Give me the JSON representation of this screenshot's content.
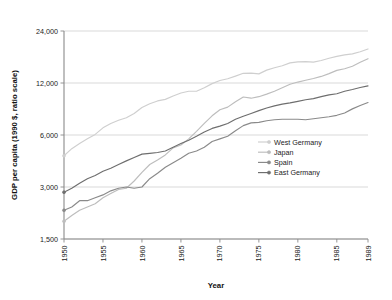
{
  "chart_data": {
    "type": "line",
    "title": "",
    "xlabel": "Year",
    "ylabel": "GDP per capita (1990 $, ratio scale)",
    "yscale": "log",
    "ylim": [
      1500,
      24000
    ],
    "xlim": [
      1950,
      1989
    ],
    "grid": true,
    "legend_position": "center-right",
    "ytick_labels": [
      "1,500",
      "3,000",
      "6,000",
      "12,000",
      "24,000"
    ],
    "ytick_values": [
      1500,
      3000,
      6000,
      12000,
      24000
    ],
    "xtick_labels": [
      "1950",
      "1955",
      "1960",
      "1965",
      "1970",
      "1975",
      "1980",
      "1985",
      "1989"
    ],
    "xtick_values": [
      1950,
      1955,
      1960,
      1965,
      1970,
      1975,
      1980,
      1985,
      1989
    ],
    "x": [
      1950,
      1951,
      1952,
      1953,
      1954,
      1955,
      1956,
      1957,
      1958,
      1959,
      1960,
      1961,
      1962,
      1963,
      1964,
      1965,
      1966,
      1967,
      1968,
      1969,
      1970,
      1971,
      1972,
      1973,
      1974,
      1975,
      1976,
      1977,
      1978,
      1979,
      1980,
      1981,
      1982,
      1983,
      1984,
      1985,
      1986,
      1987,
      1988,
      1989
    ],
    "series": [
      {
        "name": "West Germany",
        "color": "#cfcfcf",
        "values": [
          4550,
          5000,
          5350,
          5700,
          6050,
          6600,
          7000,
          7300,
          7550,
          8000,
          8650,
          9100,
          9450,
          9650,
          10100,
          10500,
          10750,
          10750,
          11250,
          11900,
          12400,
          12700,
          13150,
          13650,
          13700,
          13550,
          14250,
          14700,
          15100,
          15700,
          15900,
          15950,
          15850,
          16200,
          16700,
          17100,
          17450,
          17700,
          18200,
          18900
        ]
      },
      {
        "name": "Japan",
        "color": "#bdbdbd",
        "values": [
          1900,
          2050,
          2200,
          2300,
          2400,
          2600,
          2750,
          2900,
          2950,
          3250,
          3650,
          4050,
          4300,
          4600,
          5050,
          5250,
          5700,
          6300,
          7000,
          7750,
          8400,
          8700,
          9350,
          9950,
          9800,
          10000,
          10350,
          10750,
          11250,
          11800,
          12150,
          12450,
          12750,
          13100,
          13600,
          14200,
          14500,
          15000,
          15800,
          16600
        ]
      },
      {
        "name": "Spain",
        "color": "#8a8a8a",
        "values": [
          2200,
          2300,
          2500,
          2500,
          2600,
          2700,
          2850,
          2950,
          3000,
          2950,
          3000,
          3350,
          3600,
          3900,
          4150,
          4400,
          4700,
          4850,
          5100,
          5500,
          5700,
          5900,
          6350,
          6800,
          7050,
          7100,
          7250,
          7350,
          7400,
          7400,
          7400,
          7350,
          7450,
          7550,
          7650,
          7800,
          8050,
          8500,
          8900,
          9250
        ]
      },
      {
        "name": "East Germany",
        "color": "#6e6e6e",
        "values": [
          2800,
          2950,
          3150,
          3350,
          3500,
          3700,
          3850,
          4050,
          4250,
          4450,
          4650,
          4700,
          4750,
          4850,
          5100,
          5350,
          5600,
          5900,
          6250,
          6550,
          6750,
          7000,
          7400,
          7700,
          8000,
          8300,
          8600,
          8850,
          9050,
          9200,
          9400,
          9600,
          9750,
          10000,
          10250,
          10400,
          10750,
          11000,
          11300,
          11550
        ]
      }
    ]
  },
  "legend": {
    "items": [
      {
        "label": "West Germany"
      },
      {
        "label": "Japan"
      },
      {
        "label": "Spain"
      },
      {
        "label": "East Germany"
      }
    ]
  }
}
